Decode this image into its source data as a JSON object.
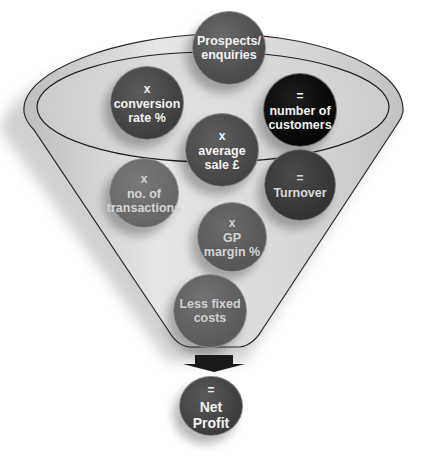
{
  "diagram": {
    "type": "funnel",
    "colors": {
      "funnel_fill": "#dcdcdc",
      "funnel_outline": "#2a2a2a",
      "bubble_default": "#555555",
      "bubble_dark": "#111111",
      "bubble_mid": "#3c3c3c",
      "bubble_light": "#6e6e6e",
      "arrow": "#1a1a1a"
    },
    "bubbles": [
      {
        "id": "prospects",
        "operator": "",
        "lines": [
          "Prospects/",
          "enquiries"
        ]
      },
      {
        "id": "conversion",
        "operator": "x",
        "lines": [
          "conversion",
          "rate %"
        ]
      },
      {
        "id": "customers",
        "operator": "=",
        "lines": [
          "number of",
          "customers"
        ]
      },
      {
        "id": "average-sale",
        "operator": "x",
        "lines": [
          "average",
          "sale £"
        ]
      },
      {
        "id": "transactions",
        "operator": "x",
        "lines": [
          "no. of",
          "transactions"
        ]
      },
      {
        "id": "turnover",
        "operator": "=",
        "lines": [
          "Turnover"
        ]
      },
      {
        "id": "gp-margin",
        "operator": "x",
        "lines": [
          "GP",
          "margin %"
        ]
      },
      {
        "id": "fixed-costs",
        "operator": "",
        "lines": [
          "Less fixed",
          "costs"
        ]
      },
      {
        "id": "net-profit",
        "operator": "=",
        "lines": [
          "Net",
          "Profit"
        ]
      }
    ]
  }
}
